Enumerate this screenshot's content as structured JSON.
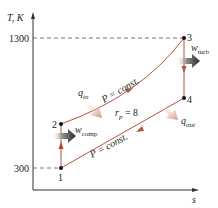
{
  "diagram": {
    "y_axis_label": "T, K",
    "x_axis_label": "s",
    "ticks": [
      {
        "label": "1300",
        "value": 1300
      },
      {
        "label": "300",
        "value": 300
      }
    ],
    "states": [
      {
        "label": "1"
      },
      {
        "label": "2"
      },
      {
        "label": "3"
      },
      {
        "label": "4"
      }
    ],
    "process_labels": {
      "upper_isobar": "P = const.",
      "lower_isobar": "P = const.",
      "pressure_ratio": "r",
      "pressure_ratio_sub": "p",
      "pressure_ratio_value": " = 8"
    },
    "energy_labels": {
      "q_in": "q",
      "q_in_sub": "in",
      "q_out": "q",
      "q_out_sub": "out",
      "w_comp": "w",
      "w_comp_sub": "comp",
      "w_turb": "w",
      "w_turb_sub": "turb"
    },
    "colors": {
      "process_line": "#b5513f",
      "axis": "#333333",
      "dashed": "#555555",
      "heat_arrow": "#e3a898",
      "work_arrow": "#3a3a3a"
    }
  }
}
